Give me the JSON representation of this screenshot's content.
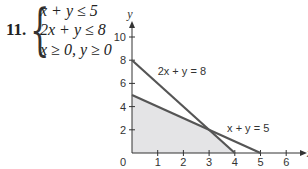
{
  "problem": {
    "number": "11.",
    "inequalities": [
      "x + y ≤ 5",
      "2x + y ≤ 8",
      "x ≥ 0, y ≥ 0"
    ]
  },
  "colors": {
    "line": "#555555",
    "feasible_fill": "#e4e4e6",
    "axis": "#333333"
  },
  "chart_data": {
    "type": "area",
    "title": "",
    "xlabel": "x",
    "ylabel": "y",
    "xlim": [
      0,
      6.5
    ],
    "ylim": [
      0,
      11
    ],
    "grid": false,
    "x_ticks": [
      1,
      2,
      3,
      4,
      5,
      6
    ],
    "y_ticks": [
      2,
      4,
      6,
      8,
      10
    ],
    "origin_label": "0",
    "series": [
      {
        "name": "2x + y = 8",
        "points": [
          [
            0,
            8
          ],
          [
            4,
            0
          ]
        ]
      },
      {
        "name": "x + y = 5",
        "points": [
          [
            0,
            5
          ],
          [
            5,
            0
          ]
        ]
      }
    ],
    "feasible_region": {
      "vertices": [
        [
          0,
          0
        ],
        [
          0,
          5
        ],
        [
          3,
          2
        ],
        [
          4,
          0
        ]
      ],
      "shaded": true
    },
    "annotations": [
      {
        "text": "2x + y = 8",
        "x": 1,
        "y": 6.7
      },
      {
        "text": "x + y = 5",
        "x": 3.7,
        "y": 1.8
      }
    ]
  }
}
